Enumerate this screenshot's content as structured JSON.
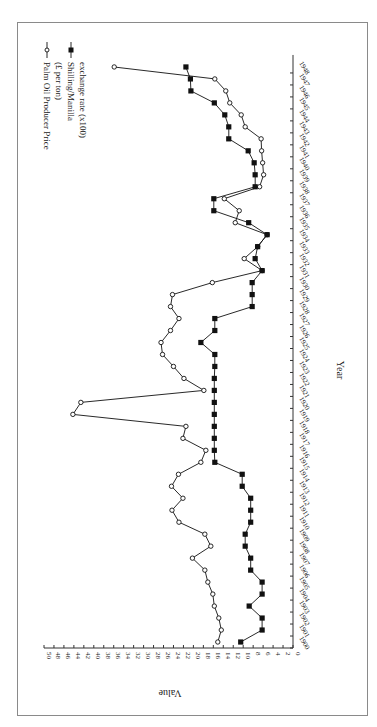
{
  "chart_data": {
    "type": "line",
    "title": "",
    "orientation": "rotated 90 degrees clockwise (years run bottom-to-top along right side, values increase leftward)",
    "xlabel": "Year",
    "ylabel": "Value",
    "ylim": [
      0,
      50
    ],
    "y_ticks": [
      0,
      2,
      4,
      6,
      8,
      10,
      12,
      14,
      16,
      18,
      20,
      22,
      24,
      26,
      28,
      30,
      32,
      34,
      36,
      38,
      40,
      42,
      44,
      46,
      48,
      50
    ],
    "x": [
      1900,
      1901,
      1902,
      1903,
      1904,
      1905,
      1906,
      1907,
      1908,
      1909,
      1910,
      1911,
      1912,
      1913,
      1914,
      1915,
      1916,
      1917,
      1918,
      1919,
      1920,
      1921,
      1922,
      1923,
      1924,
      1925,
      1926,
      1927,
      1928,
      1929,
      1930,
      1931,
      1932,
      1933,
      1934,
      1935,
      1936,
      1937,
      1938,
      1939,
      1940,
      1941,
      1942,
      1943,
      1944,
      1945,
      1946,
      1947,
      1948
    ],
    "series": [
      {
        "name": "Palm Oil Producer Price (£ per ton)",
        "marker": "open-circle",
        "values": [
          15.1,
          14.4,
          14.9,
          15.8,
          16.1,
          17.1,
          17.7,
          20.2,
          16.5,
          17.7,
          22.9,
          24.3,
          22.1,
          24.4,
          23.0,
          18.5,
          17.5,
          22.1,
          21.5,
          44.2,
          42.6,
          17.9,
          21.9,
          24.0,
          26.2,
          26.5,
          24.6,
          22.9,
          24.6,
          24.2,
          16.2,
          6.2,
          9.8,
          7.1,
          5.2,
          11.6,
          10.8,
          13.8,
          6.7,
          5.9,
          6.1,
          6.3,
          6.4,
          9.6,
          10.4,
          12.7,
          13.5,
          15.7,
          35.9
        ]
      },
      {
        "name": "Shilling/Manilla exchange rate (x100)",
        "marker": "filled-square",
        "values": [
          10.5,
          6.2,
          6.2,
          8.8,
          6.2,
          6.2,
          8.5,
          8.5,
          9.6,
          9.6,
          8.5,
          8.5,
          8.5,
          10.2,
          10.2,
          15.7,
          15.8,
          15.8,
          15.8,
          15.8,
          15.8,
          15.8,
          15.8,
          15.7,
          15.7,
          18.5,
          15.7,
          15.7,
          8.2,
          8.2,
          8.2,
          6.2,
          7.6,
          7.1,
          5.2,
          8.9,
          15.9,
          15.9,
          7.6,
          7.6,
          7.8,
          9.0,
          12.9,
          12.9,
          13.7,
          15.8,
          20.5,
          20.6,
          21.5
        ]
      }
    ],
    "legend": {
      "position": "top-left (rotated)",
      "entries": [
        [
          "Palm Oil Producer Price",
          "(£ per ton)"
        ],
        [
          "Shilling/Manilla",
          "exchange rate (x100)"
        ]
      ]
    },
    "grid": false
  },
  "axis": {
    "x_label": "Year",
    "y_label": "Value"
  }
}
